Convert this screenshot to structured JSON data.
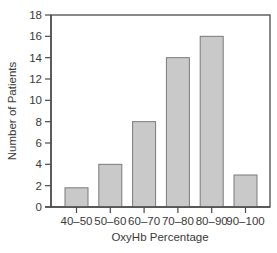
{
  "chart_data": {
    "type": "bar",
    "title": "",
    "xlabel": "OxyHb Percentage",
    "ylabel": "Number of Patients",
    "categories": [
      "40–50",
      "50–60",
      "60–70",
      "70–80",
      "80–90",
      "90–100"
    ],
    "values": [
      1.8,
      4,
      8,
      14,
      16,
      3
    ],
    "ylim": [
      0,
      18
    ],
    "yticks": [
      0,
      2,
      4,
      6,
      8,
      10,
      12,
      14,
      16,
      18
    ],
    "grid": false,
    "legend": null,
    "colors": {
      "bar_fill": "#c9c9c9",
      "bar_stroke": "#7a7a7a",
      "axis": "#4a4a4a",
      "text": "#3a3a3a"
    }
  }
}
